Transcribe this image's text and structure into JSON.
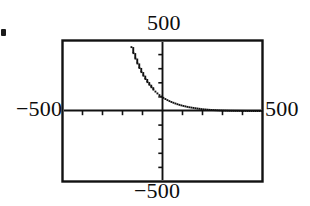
{
  "figure": {
    "kind": "graphing-calculator-plot",
    "ink_color": "#111111",
    "background_color": "#ffffff"
  },
  "labels": {
    "top": "500",
    "bottom": "−500",
    "left": "−500",
    "right": "500"
  },
  "chart_data": {
    "type": "line",
    "title": "",
    "xlabel": "",
    "ylabel": "",
    "xlim": [
      -500,
      500
    ],
    "ylim": [
      -500,
      500
    ],
    "xticks": [
      -500,
      -400,
      -300,
      -200,
      -100,
      0,
      100,
      200,
      300,
      400,
      500
    ],
    "yticks": [
      -500,
      -400,
      -300,
      -200,
      -100,
      0,
      100,
      200,
      300,
      400,
      500
    ],
    "xtick_labels": [
      "−500",
      "",
      "",
      "",
      "",
      "",
      "",
      "",
      "",
      "",
      "500"
    ],
    "ytick_labels": [
      "−500",
      "",
      "",
      "",
      "",
      "",
      "",
      "",
      "",
      "",
      "500"
    ],
    "grid": false,
    "legend": null,
    "axes_style": "centered-crosshair-with-box-frame",
    "series": [
      {
        "name": "exponential decay",
        "style": "dotted",
        "x": [
          -165,
          -150,
          -135,
          -120,
          -105,
          -90,
          -75,
          -60,
          -45,
          -30,
          -15,
          0,
          20,
          40,
          60,
          80,
          100,
          130,
          160,
          200,
          240,
          290,
          340,
          400,
          460,
          500
        ],
        "y": [
          500,
          430,
          372,
          320,
          276,
          238,
          205,
          177,
          152,
          131,
          113,
          98,
          81,
          67,
          56,
          46,
          38,
          28,
          21,
          13,
          8,
          4,
          2,
          1,
          0,
          0
        ]
      }
    ]
  }
}
